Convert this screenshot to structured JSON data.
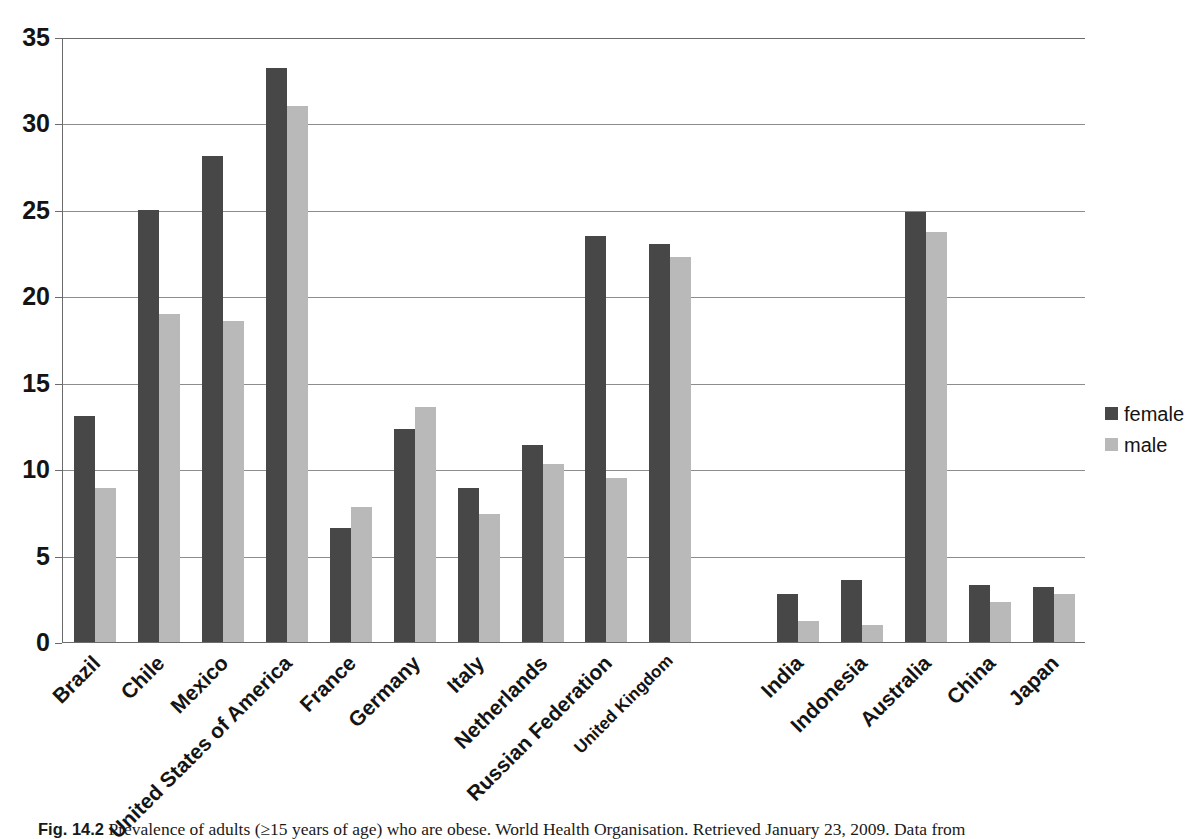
{
  "figure": {
    "caption_number": "Fig. 14.2",
    "caption_text": "Prevalence of adults (≥15 years of age) who are obese. World Health Organisation. Retrieved January 23, 2009. Data from"
  },
  "legend": {
    "position": "right",
    "items": [
      {
        "label": "female",
        "color": "#474747"
      },
      {
        "label": "male",
        "color": "#b9b9b9"
      }
    ]
  },
  "axes": {
    "yticks": [
      "0",
      "5",
      "10",
      "15",
      "20",
      "25",
      "30",
      "35"
    ],
    "ymin": 0,
    "ymax": 35,
    "ystep": 5,
    "grid": true
  },
  "chart_data": {
    "type": "bar",
    "title": "",
    "xlabel": "",
    "ylabel": "",
    "ylim": [
      0,
      35
    ],
    "grid": true,
    "legend_position": "right",
    "categories": [
      "Brazil",
      "Chile",
      "Mexico",
      "United States of America",
      "France",
      "Germany",
      "Italy",
      "Netherlands",
      "Russian Federation",
      "United Kingdom",
      "India",
      "Indonesia",
      "Australia",
      "China",
      "Japan"
    ],
    "series": [
      {
        "name": "female",
        "color": "#474747",
        "values": [
          13.1,
          25.0,
          28.1,
          33.2,
          6.6,
          12.3,
          8.9,
          11.4,
          23.5,
          23.0,
          2.8,
          3.6,
          24.9,
          3.3,
          3.2
        ]
      },
      {
        "name": "male",
        "color": "#b9b9b9",
        "values": [
          8.9,
          19.0,
          18.6,
          31.0,
          7.8,
          13.6,
          7.4,
          10.3,
          9.5,
          22.3,
          1.2,
          1.0,
          23.7,
          2.3,
          2.8
        ]
      }
    ]
  },
  "colors": {
    "female": "#474747",
    "male": "#b9b9b9",
    "axis": "#6b6b6b",
    "grid": "#8d8d8d",
    "background": "#ffffff"
  }
}
